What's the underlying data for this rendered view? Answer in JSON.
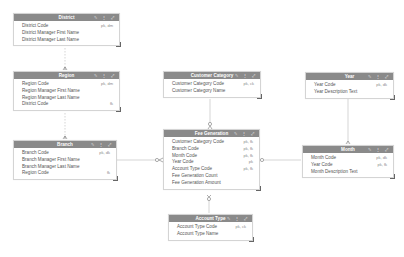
{
  "diagram": {
    "header_color": "#8a8a8a",
    "entities": [
      {
        "id": "district",
        "title": "District",
        "icons": "✎ ⋮ ⤢",
        "attributes": [
          {
            "name": "District Code",
            "key": "pk, dm"
          },
          {
            "name": "District Manager First Name",
            "key": ""
          },
          {
            "name": "District Manager Last Name",
            "key": ""
          }
        ]
      },
      {
        "id": "region",
        "title": "Region",
        "icons": "✎ ⋮ ⤢",
        "attributes": [
          {
            "name": "Region Code",
            "key": "pk, dm"
          },
          {
            "name": "Region Manager First Name",
            "key": ""
          },
          {
            "name": "Region Manager Last Name",
            "key": ""
          },
          {
            "name": "District Code",
            "key": "fk"
          }
        ]
      },
      {
        "id": "branch",
        "title": "Branch",
        "icons": "✎ ⋮ ⤢",
        "attributes": [
          {
            "name": "Branch Code",
            "key": "pk, dk"
          },
          {
            "name": "Branch Manager First Name",
            "key": ""
          },
          {
            "name": "Branch Manager Last Name",
            "key": ""
          },
          {
            "name": "Region Code",
            "key": "fk"
          }
        ]
      },
      {
        "id": "customer_category",
        "title": "Customer Category",
        "icons": "✎ ⋮ ⤢",
        "attributes": [
          {
            "name": "Customer Category Code",
            "key": "pk, ck"
          },
          {
            "name": "Customer Category Name",
            "key": ""
          }
        ]
      },
      {
        "id": "fee_generation",
        "title": "Fee Generation",
        "icons": "✎ ⋮ ⤢",
        "attributes": [
          {
            "name": "Customer Category Code",
            "key": "pk, fk"
          },
          {
            "name": "Branch Code",
            "key": "pk, fk"
          },
          {
            "name": "Month Code",
            "key": "pk, fk"
          },
          {
            "name": "Year Code",
            "key": "pk"
          },
          {
            "name": "Account Type Code",
            "key": "pk, fk"
          },
          {
            "name": "Fee Generation Count",
            "key": ""
          },
          {
            "name": "Fee Generation Amount",
            "key": ""
          }
        ]
      },
      {
        "id": "year",
        "title": "Year",
        "icons": "✎ ⋮ ⤢",
        "attributes": [
          {
            "name": "Year Code",
            "key": "pk, dk"
          },
          {
            "name": "Year Description Text",
            "key": ""
          }
        ]
      },
      {
        "id": "month",
        "title": "Month",
        "icons": "✎ ⋮ ⤢",
        "attributes": [
          {
            "name": "Month Code",
            "key": "pk, dk"
          },
          {
            "name": "Year Code",
            "key": "pk, fk"
          },
          {
            "name": "Month Description Text",
            "key": ""
          }
        ]
      },
      {
        "id": "account_type",
        "title": "Account Type",
        "icons": "✎ ⋮ ⤢",
        "attributes": [
          {
            "name": "Account Type Code",
            "key": "pk, ck"
          },
          {
            "name": "Account Type Name",
            "key": ""
          }
        ]
      }
    ],
    "relationships": [
      {
        "from": "district",
        "to": "region"
      },
      {
        "from": "region",
        "to": "branch"
      },
      {
        "from": "branch",
        "to": "fee_generation"
      },
      {
        "from": "customer_category",
        "to": "fee_generation"
      },
      {
        "from": "month",
        "to": "fee_generation"
      },
      {
        "from": "account_type",
        "to": "fee_generation"
      },
      {
        "from": "year",
        "to": "month"
      }
    ]
  }
}
